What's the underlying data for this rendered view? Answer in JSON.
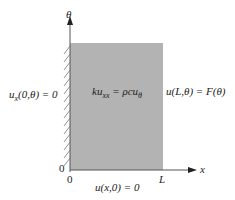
{
  "diagram": {
    "axis_labels": {
      "vertical": "θ",
      "horizontal": "x"
    },
    "domain_fill": "#b3b3b3",
    "equation": "ku",
    "equation_sub": "xx",
    "equation_rhs": " = ρcu",
    "equation_rhs_sub": "θ",
    "left_bc_pre": "u",
    "left_bc_sub": "x",
    "left_bc_post": "(0,θ) = 0",
    "right_bc": "u(L,θ) = F(θ)",
    "bottom_bc": "u(x,0) = 0",
    "origin_vertical": "0",
    "origin_horizontal": "0",
    "length_label": "L"
  }
}
